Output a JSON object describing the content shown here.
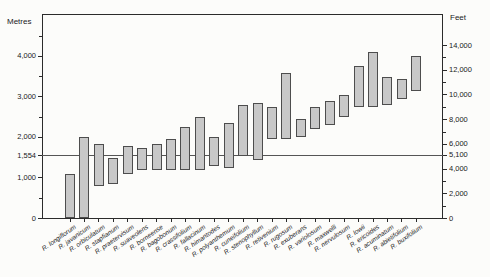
{
  "colors": {
    "background": "#fcfcfa",
    "frame": "#2b2b2b",
    "bar_fill": "#c8c8c8",
    "bar_stroke": "#4d4d4d",
    "reference_line": "#555555",
    "text": "#1a1a1a"
  },
  "chart_data": {
    "type": "bar",
    "subtype": "floating-altitudinal-range-bars",
    "title": "",
    "left_axis": {
      "label": "Metres",
      "major_ticks": [
        0,
        1000,
        1554,
        2000,
        3000,
        4000
      ],
      "minor_ticks": [
        500,
        2500,
        3500,
        4500
      ],
      "range_metres": [
        0,
        5050
      ]
    },
    "right_axis": {
      "label": "Feet",
      "major_ticks": [
        0,
        2000,
        4000,
        5100,
        6000,
        8000,
        10000,
        12000,
        14000
      ],
      "minor_ticks": [
        1000,
        3000,
        7000,
        9000,
        11000,
        13000
      ],
      "feet_per_metre": 3.2808
    },
    "reference_line": {
      "metres": 1554,
      "feet": 5100
    },
    "grid": "off",
    "legend": "none",
    "species": [
      {
        "name": "R. longiflorum",
        "min_m": 0,
        "max_m": 1100
      },
      {
        "name": "R. javanicum",
        "min_m": 0,
        "max_m": 2000
      },
      {
        "name": "R. orbiculatum",
        "min_m": 800,
        "max_m": 1850
      },
      {
        "name": "R. stapfianum",
        "min_m": 850,
        "max_m": 1500
      },
      {
        "name": "R. praetervisum",
        "min_m": 1100,
        "max_m": 1800
      },
      {
        "name": "R. suaveolens",
        "min_m": 1200,
        "max_m": 1750
      },
      {
        "name": "R. borneense",
        "min_m": 1200,
        "max_m": 1850
      },
      {
        "name": "R. bagobonum",
        "min_m": 1200,
        "max_m": 1950
      },
      {
        "name": "R. crassifolium",
        "min_m": 1200,
        "max_m": 2250
      },
      {
        "name": "R. fallacinum",
        "min_m": 1200,
        "max_m": 2500
      },
      {
        "name": "R. himantodes",
        "min_m": 1300,
        "max_m": 2000
      },
      {
        "name": "R. polyanthemum",
        "min_m": 1250,
        "max_m": 2350
      },
      {
        "name": "R. cuneifolium",
        "min_m": 1550,
        "max_m": 2800
      },
      {
        "name": "R. stenophyllum",
        "min_m": 1450,
        "max_m": 2850
      },
      {
        "name": "R. retivenium",
        "min_m": 1950,
        "max_m": 2750
      },
      {
        "name": "R. rugosum",
        "min_m": 1950,
        "max_m": 3600
      },
      {
        "name": "R. exuberans",
        "min_m": 2000,
        "max_m": 2450
      },
      {
        "name": "R. variolosum",
        "min_m": 2200,
        "max_m": 2750
      },
      {
        "name": "R. maxwelli",
        "min_m": 2300,
        "max_m": 2900
      },
      {
        "name": "R. nervulosum",
        "min_m": 2500,
        "max_m": 3050
      },
      {
        "name": "R. lowii",
        "min_m": 2750,
        "max_m": 3750
      },
      {
        "name": "R. ericoides",
        "min_m": 2750,
        "max_m": 4100
      },
      {
        "name": "R. acuminatum",
        "min_m": 2800,
        "max_m": 3500
      },
      {
        "name": "R. abietifolium",
        "min_m": 2950,
        "max_m": 3450
      },
      {
        "name": "R. buxifolium",
        "min_m": 3150,
        "max_m": 4000
      }
    ]
  }
}
